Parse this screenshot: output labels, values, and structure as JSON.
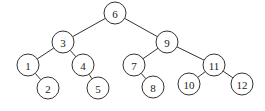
{
  "diagram": {
    "type": "binary-search-tree",
    "node_radius": 11,
    "colors": {
      "stroke": "#333333",
      "fill": "#ffffff",
      "text": "#222222"
    },
    "nodes": [
      {
        "id": "6",
        "label": "6",
        "x": 115,
        "y": 13
      },
      {
        "id": "3",
        "label": "3",
        "x": 63,
        "y": 42
      },
      {
        "id": "9",
        "label": "9",
        "x": 167,
        "y": 42
      },
      {
        "id": "1",
        "label": "1",
        "x": 28,
        "y": 65
      },
      {
        "id": "4",
        "label": "4",
        "x": 83,
        "y": 65
      },
      {
        "id": "7",
        "label": "7",
        "x": 134,
        "y": 65
      },
      {
        "id": "11",
        "label": "11",
        "x": 214,
        "y": 65
      },
      {
        "id": "2",
        "label": "2",
        "x": 48,
        "y": 88
      },
      {
        "id": "5",
        "label": "5",
        "x": 98,
        "y": 88
      },
      {
        "id": "8",
        "label": "8",
        "x": 153,
        "y": 87
      },
      {
        "id": "10",
        "label": "10",
        "x": 189,
        "y": 84
      },
      {
        "id": "12",
        "label": "12",
        "x": 242,
        "y": 84
      }
    ],
    "edges": [
      {
        "from": "6",
        "to": "3"
      },
      {
        "from": "6",
        "to": "9"
      },
      {
        "from": "3",
        "to": "1"
      },
      {
        "from": "3",
        "to": "4"
      },
      {
        "from": "1",
        "to": "2"
      },
      {
        "from": "4",
        "to": "5"
      },
      {
        "from": "9",
        "to": "7"
      },
      {
        "from": "9",
        "to": "11"
      },
      {
        "from": "7",
        "to": "8"
      },
      {
        "from": "11",
        "to": "10"
      },
      {
        "from": "11",
        "to": "12"
      }
    ]
  }
}
